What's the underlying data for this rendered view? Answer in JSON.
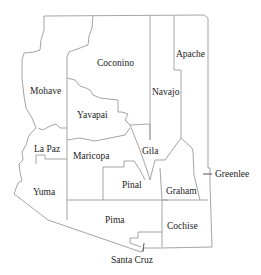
{
  "map": {
    "title": "Arizona Counties",
    "counties": [
      {
        "name": "Mohave",
        "x": 30,
        "y": 87
      },
      {
        "name": "Coconino",
        "x": 97,
        "y": 59
      },
      {
        "name": "Navajo",
        "x": 152,
        "y": 88
      },
      {
        "name": "Apache",
        "x": 176,
        "y": 50
      },
      {
        "name": "Yavapai",
        "x": 77,
        "y": 111
      },
      {
        "name": "La Paz",
        "x": 34,
        "y": 145
      },
      {
        "name": "Maricopa",
        "x": 73,
        "y": 152
      },
      {
        "name": "Gila",
        "x": 142,
        "y": 147
      },
      {
        "name": "Pinal",
        "x": 122,
        "y": 181
      },
      {
        "name": "Graham",
        "x": 166,
        "y": 187
      },
      {
        "name": "Greenlee",
        "x": 215,
        "y": 170
      },
      {
        "name": "Yuma",
        "x": 33,
        "y": 188
      },
      {
        "name": "Pima",
        "x": 105,
        "y": 216
      },
      {
        "name": "Cochise",
        "x": 167,
        "y": 222
      },
      {
        "name": "Santa Cruz",
        "x": 111,
        "y": 256
      }
    ]
  }
}
